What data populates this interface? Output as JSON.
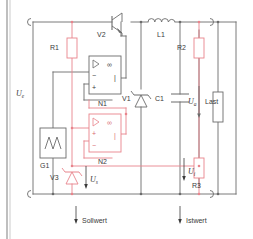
{
  "figure": {
    "type": "circuit-schematic",
    "title_visible": false,
    "colors": {
      "wire_black": "#6b6b6b",
      "wire_red": "#e8848c",
      "component_red": "#e8848c",
      "text": "#3a3a3a",
      "background": "#ffffff",
      "border": "#6b6b6b"
    }
  },
  "components": {
    "r1": {
      "ref": "R1",
      "kind": "resistor",
      "color": "red"
    },
    "r2": {
      "ref": "R2",
      "kind": "resistor",
      "color": "red"
    },
    "r3": {
      "ref": "R3",
      "kind": "resistor",
      "color": "red"
    },
    "c1": {
      "ref": "C1",
      "kind": "capacitor",
      "color": "black"
    },
    "l1": {
      "ref": "L1",
      "kind": "inductor",
      "color": "black"
    },
    "v1": {
      "ref": "V1",
      "kind": "diode",
      "color": "black"
    },
    "v2": {
      "ref": "V2",
      "kind": "transistor",
      "color": "black"
    },
    "v3": {
      "ref": "V3",
      "kind": "zener-diode",
      "color": "red"
    },
    "n1": {
      "ref": "N1",
      "kind": "operational-amplifier",
      "color": "black",
      "gain": "∞",
      "inputs": [
        "−",
        "+"
      ]
    },
    "n2": {
      "ref": "N2",
      "kind": "operational-amplifier",
      "color": "red",
      "gain": "∞",
      "inputs": [
        "+",
        "−"
      ]
    },
    "g1": {
      "ref": "G1",
      "kind": "ramp-generator",
      "symbol": "sawtooth",
      "color": "black"
    },
    "load": {
      "ref": "Last",
      "kind": "load-resistor",
      "color": "black"
    }
  },
  "labels": {
    "u_e": {
      "text": "U",
      "sub": "e",
      "meaning": "input-voltage"
    },
    "u_a": {
      "text": "U",
      "sub": "a",
      "meaning": "output-voltage"
    },
    "u_s": {
      "text": "U",
      "sub": "s",
      "meaning": "setpoint-voltage"
    },
    "u_i": {
      "text": "U",
      "sub": "i",
      "meaning": "actual-voltage"
    },
    "load": "Last",
    "sollwert": "Sollwert",
    "istwert": "Istwert"
  },
  "terminals": {
    "input_top": "input-positive",
    "input_bottom": "input-negative",
    "output_top": "output-positive",
    "output_bottom": "output-negative"
  }
}
